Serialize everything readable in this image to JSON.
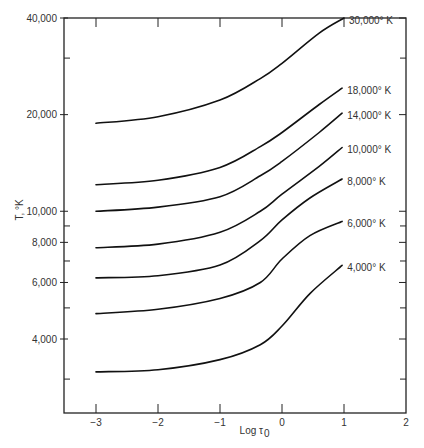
{
  "chart_data": {
    "type": "line",
    "title": "",
    "xlabel": "Log τ0",
    "ylabel": "T, °K",
    "xscale": "linear",
    "yscale": "log",
    "xlim": [
      -3.5,
      2
    ],
    "ylim": [
      2356,
      40000
    ],
    "grid": false,
    "legend_position": "inline-right",
    "x_ticks": [
      -3,
      -2,
      -1,
      0,
      1,
      2
    ],
    "x_tick_labels": [
      "−3",
      "−2",
      "−1",
      "0",
      "1",
      "2"
    ],
    "y_ticks": [
      4000,
      6000,
      8000,
      10000,
      20000,
      40000
    ],
    "y_tick_labels": [
      "4,000",
      "6,000",
      "8,000",
      "10,000",
      "20,000",
      "40,000"
    ],
    "y_minor_ticks": [
      3000,
      5000,
      7000,
      9000,
      30000
    ],
    "series": [
      {
        "name": "30,000° K",
        "label": "30,000° K",
        "x": [
          -3.0,
          -2.0,
          -1.0,
          -0.35,
          0.0,
          0.6,
          1.0
        ],
        "y": [
          18800,
          19700,
          22200,
          25900,
          28900,
          35900,
          40000
        ]
      },
      {
        "name": "18,000° K",
        "label": "18,000° K",
        "x": [
          -3.0,
          -2.0,
          -1.0,
          -0.35,
          0.0,
          0.6,
          0.97
        ],
        "y": [
          12100,
          12500,
          13700,
          15900,
          17600,
          21500,
          24200
        ]
      },
      {
        "name": "14,000° K",
        "label": "14,000° K",
        "x": [
          -3.0,
          -2.0,
          -1.0,
          -0.35,
          0.0,
          0.6,
          0.97
        ],
        "y": [
          10000,
          10300,
          11100,
          12900,
          14300,
          17600,
          20200
        ]
      },
      {
        "name": "10,000° K",
        "label": "10,000° K",
        "x": [
          -3.0,
          -2.0,
          -1.0,
          -0.35,
          0.0,
          0.6,
          0.97
        ],
        "y": [
          7700,
          7900,
          8600,
          10000,
          11300,
          13800,
          15800
        ]
      },
      {
        "name": "8,000° K",
        "label": "8,000° K",
        "x": [
          -3.0,
          -2.0,
          -1.0,
          -0.35,
          0.0,
          0.45,
          0.97
        ],
        "y": [
          6200,
          6300,
          6800,
          8100,
          9400,
          11000,
          12600
        ]
      },
      {
        "name": "6,000° K",
        "label": "6,000° K",
        "x": [
          -3.0,
          -2.0,
          -1.0,
          -0.35,
          0.0,
          0.45,
          0.97
        ],
        "y": [
          4800,
          4950,
          5350,
          6000,
          7100,
          8400,
          9300
        ]
      },
      {
        "name": "4,000° K",
        "label": "4,000° K",
        "x": [
          -3.0,
          -2.0,
          -1.0,
          -0.35,
          0.0,
          0.45,
          0.97
        ],
        "y": [
          3160,
          3210,
          3450,
          3840,
          4390,
          5540,
          6780
        ]
      }
    ]
  },
  "axes": {
    "xlabel_main": "Log τ",
    "xlabel_sub": "0",
    "ylabel": "T, °K"
  }
}
